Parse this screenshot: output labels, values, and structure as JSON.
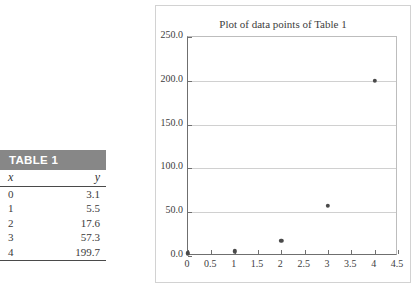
{
  "table": {
    "caption": "TABLE 1",
    "columns": [
      "x",
      "y"
    ],
    "rows": [
      {
        "x": "0",
        "y": "3.1"
      },
      {
        "x": "1",
        "y": "5.5"
      },
      {
        "x": "2",
        "y": "17.6"
      },
      {
        "x": "3",
        "y": "57.3"
      },
      {
        "x": "4",
        "y": "199.7"
      }
    ],
    "header_bg": "#878787",
    "header_text_color": "#ffffff"
  },
  "figure": {
    "title": "Plot of data points of Table 1",
    "border_color": "#d2d2d2"
  },
  "chart_data": {
    "type": "scatter",
    "title": "Plot of data points of Table 1",
    "xlabel": "",
    "ylabel": "",
    "x": [
      0,
      1,
      2,
      3,
      4
    ],
    "values": [
      3.1,
      5.5,
      17.6,
      57.3,
      199.7
    ],
    "series": [
      {
        "name": "data points of Table 1",
        "x": [
          0,
          1,
          2,
          3,
          4
        ],
        "values": [
          3.1,
          5.5,
          17.6,
          57.3,
          199.7
        ]
      }
    ],
    "xlim": [
      0,
      4.5
    ],
    "ylim": [
      0,
      250
    ],
    "xticks": [
      0,
      0.5,
      1,
      1.5,
      2,
      2.5,
      3,
      3.5,
      4,
      4.5
    ],
    "xticklabels": [
      "0",
      "0.5",
      "1",
      "1.5",
      "2",
      "2.5",
      "3",
      "3.5",
      "4",
      "4.5"
    ],
    "yticks": [
      0,
      50,
      100,
      150,
      200,
      250
    ],
    "yticklabels": [
      "0.0",
      "50.0",
      "100.0",
      "150.0",
      "200.0",
      "250.0"
    ],
    "grid": "horizontal",
    "legend": "none",
    "marker_color": "#4a4a4a",
    "marker": "circle"
  }
}
